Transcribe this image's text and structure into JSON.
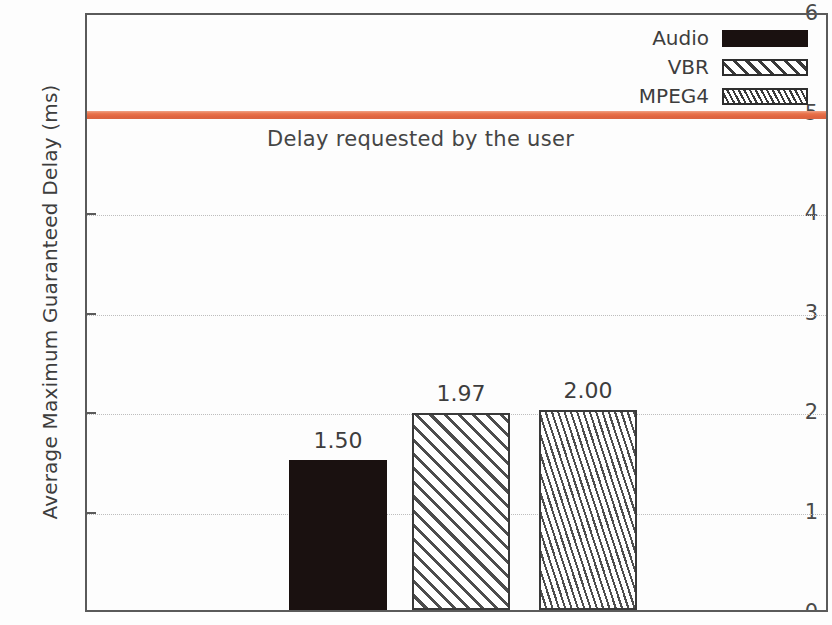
{
  "chart_data": {
    "type": "bar",
    "title": "",
    "xlabel": "",
    "ylabel": "Average Maximum Guaranteed Delay (ms)",
    "categories": [
      "Audio",
      "VBR",
      "MPEG4"
    ],
    "values": [
      1.5,
      1.97,
      2.0
    ],
    "value_labels": [
      "1.50",
      "1.97",
      "2.00"
    ],
    "ylim": [
      0,
      6
    ],
    "yticks": [
      0,
      1,
      2,
      3,
      4,
      5,
      6
    ],
    "ytick_labels": [
      "0",
      "1",
      "2",
      "3",
      "4",
      "5",
      "6"
    ],
    "grid": "horizontal-dotted",
    "legend": {
      "position": "top-right",
      "entries": [
        {
          "label": "Audio",
          "pattern": "solid-black"
        },
        {
          "label": "VBR",
          "pattern": "wide-diagonal-hatch"
        },
        {
          "label": "MPEG4",
          "pattern": "dense-diagonal-hatch"
        }
      ]
    },
    "annotations": [
      {
        "type": "hline",
        "label": "Delay requested by the user",
        "value": 5.0,
        "color": "#e8724a"
      }
    ]
  },
  "axis": {
    "ylabel": "Average Maximum Guaranteed Delay (ms)",
    "ticks": [
      {
        "label": "6",
        "value": 6
      },
      {
        "label": "5",
        "value": 5
      },
      {
        "label": "4",
        "value": 4
      },
      {
        "label": "3",
        "value": 3
      },
      {
        "label": "2",
        "value": 2
      },
      {
        "label": "1",
        "value": 1
      },
      {
        "label": "0",
        "value": 0
      }
    ]
  },
  "bars": [
    {
      "label": "Audio",
      "value_label": "1.50",
      "value": 1.5
    },
    {
      "label": "VBR",
      "value_label": "1.97",
      "value": 1.97
    },
    {
      "label": "MPEG4",
      "value_label": "2.00",
      "value": 2.0
    }
  ],
  "legend": {
    "items": [
      {
        "label": "Audio"
      },
      {
        "label": "VBR"
      },
      {
        "label": "MPEG4"
      }
    ]
  },
  "threshold": {
    "label": "Delay requested by the user",
    "value": 5.0,
    "color": "#e8724a"
  }
}
